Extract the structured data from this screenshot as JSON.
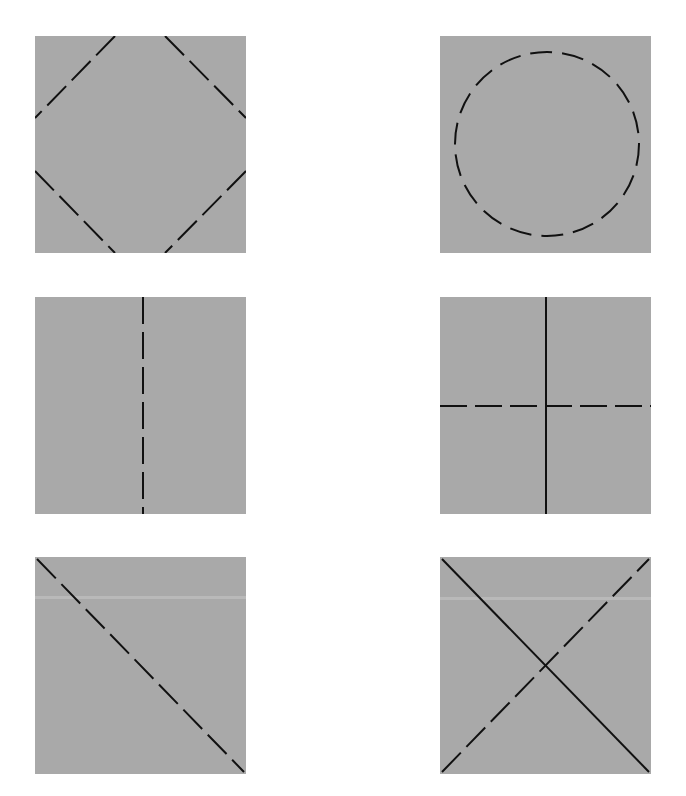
{
  "figure": {
    "background_color": "#ffffff",
    "panel_color": "#a9a9a9",
    "line_color": "#111111",
    "dash_pattern": "27 8",
    "stroke_width": 2
  },
  "panels": [
    {
      "id": "diamond",
      "label": "Dashed diamond with corners cut",
      "position": {
        "row": 1,
        "col": 1
      }
    },
    {
      "id": "circle",
      "label": "Dashed circle",
      "position": {
        "row": 1,
        "col": 2
      }
    },
    {
      "id": "vertical-dashed",
      "label": "Vertical dashed center line",
      "position": {
        "row": 2,
        "col": 1
      }
    },
    {
      "id": "cross",
      "label": "Solid vertical line and dashed horizontal line",
      "position": {
        "row": 2,
        "col": 2
      }
    },
    {
      "id": "diagonal-dashed",
      "label": "Dashed diagonal from top-left to bottom-right",
      "position": {
        "row": 3,
        "col": 1
      }
    },
    {
      "id": "x-diagonals",
      "label": "Solid diagonal top-left to bottom-right and dashed diagonal bottom-left to top-right",
      "position": {
        "row": 3,
        "col": 2
      }
    }
  ]
}
